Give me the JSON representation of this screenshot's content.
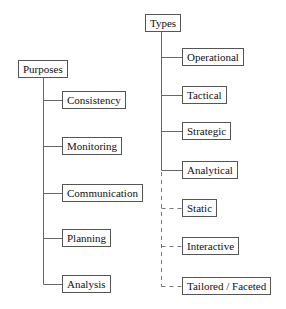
{
  "diagram": {
    "left_tree": {
      "root": "Purposes",
      "children": [
        "Consistency",
        "Monitoring",
        "Communication",
        "Planning",
        "Analysis"
      ]
    },
    "right_tree": {
      "root": "Types",
      "solid_children": [
        "Operational",
        "Tactical",
        "Strategic",
        "Analytical"
      ],
      "dashed_children": [
        "Static",
        "Interactive",
        "Tailored / Faceted"
      ]
    },
    "colors": {
      "line": "#666666",
      "border": "#555555",
      "text": "#111111",
      "background": "#ffffff"
    }
  }
}
